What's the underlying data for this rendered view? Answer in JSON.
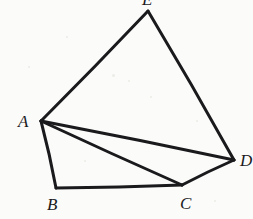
{
  "figure": {
    "kind": "geometry-diagram",
    "background_color": "#fbfbfa",
    "stroke_color": "#1a1a1d",
    "canvas": {
      "width": 253,
      "height": 219
    },
    "vertices": [
      {
        "id": "A",
        "label": "A",
        "x": 41,
        "y": 121,
        "label_x": 18,
        "label_y": 113,
        "clipped": false
      },
      {
        "id": "B",
        "label": "B",
        "x": 56,
        "y": 188,
        "label_x": 47,
        "label_y": 196,
        "clipped": false
      },
      {
        "id": "C",
        "label": "C",
        "x": 182,
        "y": 185,
        "label_x": 180,
        "label_y": 195,
        "clipped": false
      },
      {
        "id": "D",
        "label": "D",
        "x": 234,
        "y": 160,
        "label_x": 240,
        "label_y": 152,
        "clipped": true
      },
      {
        "id": "E",
        "label": "E",
        "x": 148,
        "y": 11,
        "label_x": 142,
        "label_y": -9,
        "clipped": true
      }
    ],
    "edges": [
      {
        "name": "edge-A-E",
        "from": "A",
        "to": "E",
        "width": 3.0
      },
      {
        "name": "edge-E-D",
        "from": "E",
        "to": "D",
        "width": 3.0
      },
      {
        "name": "edge-D-C",
        "from": "D",
        "to": "C",
        "width": 3.0
      },
      {
        "name": "edge-C-B",
        "from": "C",
        "to": "B",
        "width": 3.0
      },
      {
        "name": "edge-B-A",
        "from": "B",
        "to": "A",
        "width": 3.0
      },
      {
        "name": "diagonal-A-D",
        "from": "A",
        "to": "D",
        "width": 3.0
      },
      {
        "name": "diagonal-A-C",
        "from": "A",
        "to": "C",
        "width": 3.0
      }
    ],
    "specks": [
      {
        "x": 112,
        "y": 74,
        "size": 3
      },
      {
        "x": 128,
        "y": 80,
        "size": 2
      },
      {
        "x": 150,
        "y": 96,
        "size": 2
      },
      {
        "x": 28,
        "y": 66,
        "size": 2
      },
      {
        "x": 196,
        "y": 120,
        "size": 2
      },
      {
        "x": 84,
        "y": 160,
        "size": 2
      },
      {
        "x": 214,
        "y": 200,
        "size": 2
      },
      {
        "x": 66,
        "y": 36,
        "size": 2
      }
    ]
  }
}
